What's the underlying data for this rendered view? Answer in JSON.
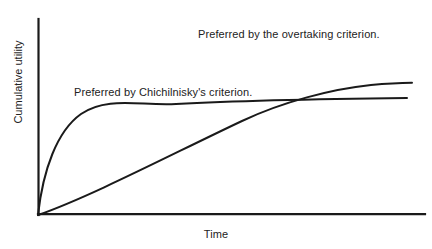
{
  "figure": {
    "background_color": "#ffffff",
    "ink_color": "#1a1a1a",
    "text_color": "#222222",
    "width": 432,
    "height": 249
  },
  "axes": {
    "y_axis_label": "Cumulative utility",
    "x_axis_label": "Time",
    "y_axis_name": "y-axis-line",
    "x_axis_name": "x-axis-line",
    "has_ticks": false,
    "has_gridlines": false,
    "has_tick_labels": false
  },
  "annotations": [
    {
      "id": "overtaking",
      "text": "Preferred by the overtaking criterion.",
      "x": 198,
      "y": 28
    },
    {
      "id": "chichilnisky",
      "text": "Preferred by Chichilnisky's criterion.",
      "x": 74,
      "y": 86
    }
  ],
  "chart_data": {
    "type": "line",
    "title": "",
    "subtitle": "",
    "xlabel": "Time",
    "ylabel": "Cumulative utility",
    "xlim": [
      0,
      1
    ],
    "ylim": [
      0,
      1
    ],
    "grid": false,
    "legend_position": "inline-annotations",
    "tick_labels": {
      "x": [],
      "y": []
    },
    "annotations": [
      "Preferred by the overtaking criterion.",
      "Preferred by Chichilnisky's criterion."
    ],
    "crossing_point": {
      "x": 0.633,
      "y": 0.587
    },
    "series": [
      {
        "name": "Chichilnisky-preferred path (fast concave rise, early plateau)",
        "style": "solid",
        "color": "#1a1a1a",
        "x": [
          0.0,
          0.03,
          0.06,
          0.1,
          0.14,
          0.19,
          0.24,
          0.3,
          0.36,
          0.43,
          0.5,
          0.57,
          0.63,
          0.7,
          0.78,
          0.86,
          0.94,
          1.0
        ],
        "y": [
          0.0,
          0.135,
          0.25,
          0.375,
          0.47,
          0.55,
          0.6,
          0.637,
          0.66,
          0.673,
          0.582,
          0.586,
          0.587,
          0.589,
          0.592,
          0.594,
          0.596,
          0.597
        ]
      },
      {
        "name": "Overtaking-preferred path (slow near-linear rise, higher limit)",
        "style": "solid",
        "color": "#1a1a1a",
        "x": [
          0.0,
          0.08,
          0.16,
          0.24,
          0.32,
          0.4,
          0.48,
          0.56,
          0.63,
          0.7,
          0.78,
          0.86,
          0.94,
          1.0
        ],
        "y": [
          0.0,
          0.073,
          0.148,
          0.224,
          0.3,
          0.376,
          0.452,
          0.525,
          0.587,
          0.645,
          0.696,
          0.728,
          0.742,
          0.746
        ]
      }
    ]
  },
  "geometry": {
    "origin": {
      "x": 38,
      "y": 215
    },
    "y_axis_top": 19,
    "x_axis_right": 425,
    "concave_curve_path": "M38,215 C44,168 58,130 82,114 C108,97 140,106 175,104 C230,101 320,99 407,98",
    "sigmoid_curve_path": "M38,215 C90,196 170,155 240,122 C280,104 330,89 370,85 C388,83.5 400,83 412,83"
  }
}
